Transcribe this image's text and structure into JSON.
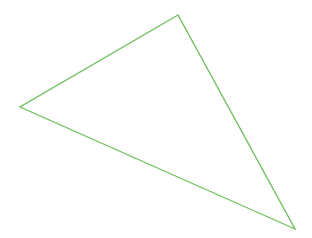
{
  "canvas": {
    "width": 312,
    "height": 238,
    "background": "#ffffff"
  },
  "shape": {
    "type": "triangle",
    "stroke": "#6cbf5a",
    "stroke_width": 1.3,
    "fill": "none",
    "vertices": [
      {
        "name": "top",
        "x": 178,
        "y": 15
      },
      {
        "name": "left",
        "x": 20,
        "y": 107
      },
      {
        "name": "bottom-right",
        "x": 295,
        "y": 229
      }
    ]
  }
}
